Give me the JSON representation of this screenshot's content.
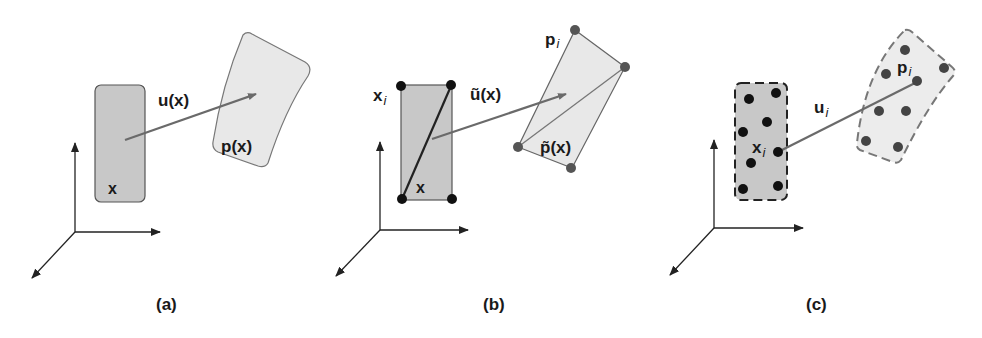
{
  "figure": {
    "panels": [
      {
        "id": "a",
        "caption": "(a)",
        "labels": {
          "displacement": "u(x)",
          "source_point": "x",
          "deformed": "p(x)"
        },
        "description": "Continuous body x mapped by displacement field u(x) to deformed configuration p(x)"
      },
      {
        "id": "b",
        "caption": "(b)",
        "labels": {
          "nodes_source": "x",
          "nodes_source_sub": "i",
          "displacement": "ũ(x)",
          "source_point": "x",
          "nodes_target": "p",
          "nodes_target_sub": "i",
          "deformed": "p̃(x)"
        },
        "description": "Finite element discretization with nodal points x_i mapped to p_i and interpolated displacement ũ(x)"
      },
      {
        "id": "c",
        "caption": "(c)",
        "labels": {
          "displacement": "u",
          "displacement_sub": "i",
          "source_point": "x",
          "source_point_sub": "i",
          "target_point": "p",
          "target_point_sub": "i"
        },
        "description": "Meshless / particle discretization: particles x_i displaced by u_i to p_i"
      }
    ],
    "colors": {
      "source_fill": "#c8c8c8",
      "target_fill": "#e8e8e8",
      "outline": "#555555",
      "arrow": "#6a6a6a",
      "node": "#222222",
      "target_node": "#555555",
      "axes": "#222222"
    }
  }
}
